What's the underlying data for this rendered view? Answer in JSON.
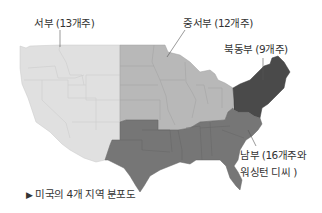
{
  "map": {
    "title": "미국의 4개 지역 분포도",
    "caption_marker": "▶",
    "regions": [
      {
        "id": "west",
        "label": "서부 (13개주)",
        "states": 13,
        "color": "#e0e0e0"
      },
      {
        "id": "midwest",
        "label": "중서부 (12개주)",
        "states": 12,
        "color": "#b8b8b8"
      },
      {
        "id": "northeast",
        "label": "북동부 (9개주)",
        "states": 9,
        "color": "#4a4a4a"
      },
      {
        "id": "south",
        "label_line1": "남부 (16개주와",
        "label_line2": "워싱턴 디씨 )",
        "states": 16,
        "color": "#767676"
      }
    ]
  }
}
